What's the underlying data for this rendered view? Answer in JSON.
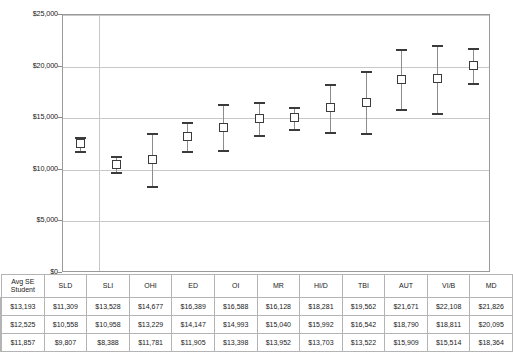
{
  "chart_data": {
    "type": "scatter",
    "title": "",
    "xlabel": "",
    "ylabel": "",
    "ylim": [
      0,
      25000
    ],
    "ytick_labels": [
      "$25,000",
      "$20,000",
      "$15,000",
      "$10,000",
      "$5,000",
      "$0"
    ],
    "ytick_values": [
      25000,
      20000,
      15000,
      10000,
      5000,
      0
    ],
    "grid": true,
    "legend_position": "table-left",
    "categories": [
      "Avg SE Student",
      "SLD",
      "SLI",
      "OHI",
      "ED",
      "OI",
      "MR",
      "HI/D",
      "TBI",
      "AUT",
      "VI/B",
      "MD"
    ],
    "series": [
      {
        "name": "upper bound",
        "marker": "dash",
        "values": [
          13193,
          11309,
          13528,
          14677,
          16389,
          16588,
          16128,
          18281,
          19562,
          21671,
          22108,
          21826
        ],
        "labels": [
          "$13,193",
          "$11,309",
          "$13,528",
          "$14,677",
          "$16,389",
          "$16,588",
          "$16,128",
          "$18,281",
          "$19,562",
          "$21,671",
          "$22,108",
          "$21,826"
        ]
      },
      {
        "name": "average",
        "marker": "square",
        "values": [
          12525,
          10558,
          10958,
          13229,
          14147,
          14993,
          15040,
          15992,
          16542,
          18790,
          18811,
          20095
        ],
        "labels": [
          "$12,525",
          "$10,558",
          "$10,958",
          "$13,229",
          "$14,147",
          "$14,993",
          "$15,040",
          "$15,992",
          "$16,542",
          "$18,790",
          "$18,811",
          "$20,095"
        ]
      },
      {
        "name": "lower bound",
        "marker": "dash",
        "values": [
          11857,
          9807,
          8388,
          11781,
          11905,
          13398,
          13952,
          13703,
          13522,
          15909,
          15514,
          18364
        ],
        "labels": [
          "$11,857",
          "$9,807",
          "$8,388",
          "$11,781",
          "$11,905",
          "$13,398",
          "$13,952",
          "$13,703",
          "$13,522",
          "$15,909",
          "$15,514",
          "$18,364"
        ]
      }
    ]
  },
  "colors": {
    "marker": "#3b3b3b",
    "gridline": "#c8c8c8",
    "plot_border": "#9a9a9a",
    "table_border": "#b4b4b4",
    "background": "#ffffff"
  }
}
